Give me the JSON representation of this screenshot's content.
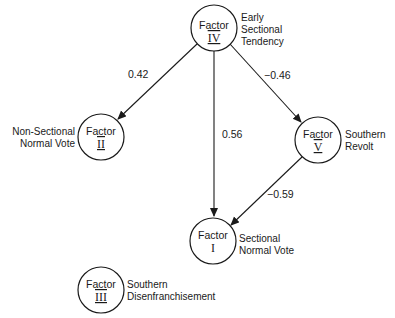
{
  "diagram": {
    "type": "path-diagram",
    "nodes": [
      {
        "id": "IV",
        "title": "Factor",
        "numeral": "IV",
        "label_lines": [
          "Early",
          "Sectional",
          "Tendency"
        ]
      },
      {
        "id": "II",
        "title": "Factor",
        "numeral": "II",
        "label_lines": [
          "Non-Sectional",
          "Normal Vote"
        ]
      },
      {
        "id": "V",
        "title": "Factor",
        "numeral": "V",
        "label_lines": [
          "Southern",
          "Revolt"
        ]
      },
      {
        "id": "I",
        "title": "Factor",
        "numeral": "I",
        "label_lines": [
          "Sectional",
          "Normal Vote"
        ]
      },
      {
        "id": "III",
        "title": "Factor",
        "numeral": "III",
        "label_lines": [
          "Southern",
          "Disenfranchisement"
        ]
      }
    ],
    "edges": [
      {
        "from": "IV",
        "to": "II",
        "weight": "0.42"
      },
      {
        "from": "IV",
        "to": "I",
        "weight": "0.56"
      },
      {
        "from": "IV",
        "to": "V",
        "weight": "−0.46"
      },
      {
        "from": "V",
        "to": "I",
        "weight": "−0.59"
      }
    ]
  }
}
